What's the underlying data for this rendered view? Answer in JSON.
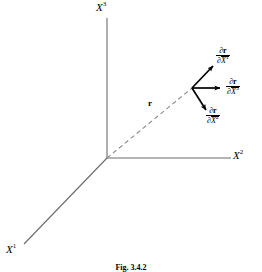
{
  "figure": {
    "caption": "Fig. 3.4.2",
    "background_color": "#ffffff",
    "axis_line_color": "#6b6b6b",
    "vector_line_color": "#8a8a8a",
    "arrow_color": "#000000"
  },
  "axes": [
    {
      "name": "x1",
      "label_base": "X",
      "label_sup": "1"
    },
    {
      "name": "x2",
      "label_base": "X",
      "label_sup": "2"
    },
    {
      "name": "x3",
      "label_base": "X",
      "label_sup": "3"
    }
  ],
  "position_vector": {
    "label": "r",
    "style": "dashed",
    "from": "origin",
    "to": "point-P"
  },
  "tangent_vectors": [
    {
      "name": "d-r-d-x1bar",
      "numerator_partial": "∂",
      "numerator_symbol": "r",
      "denominator_partial": "∂",
      "denominator_base": "X",
      "denominator_sup": "1",
      "direction": "up-right"
    },
    {
      "name": "d-r-d-x3bar",
      "numerator_partial": "∂",
      "numerator_symbol": "r",
      "denominator_partial": "∂",
      "denominator_base": "X",
      "denominator_sup": "3",
      "direction": "right"
    },
    {
      "name": "d-r-d-x2bar",
      "numerator_partial": "∂",
      "numerator_symbol": "r",
      "denominator_partial": "∂",
      "denominator_base": "X",
      "denominator_sup": "2",
      "direction": "down-right"
    }
  ]
}
